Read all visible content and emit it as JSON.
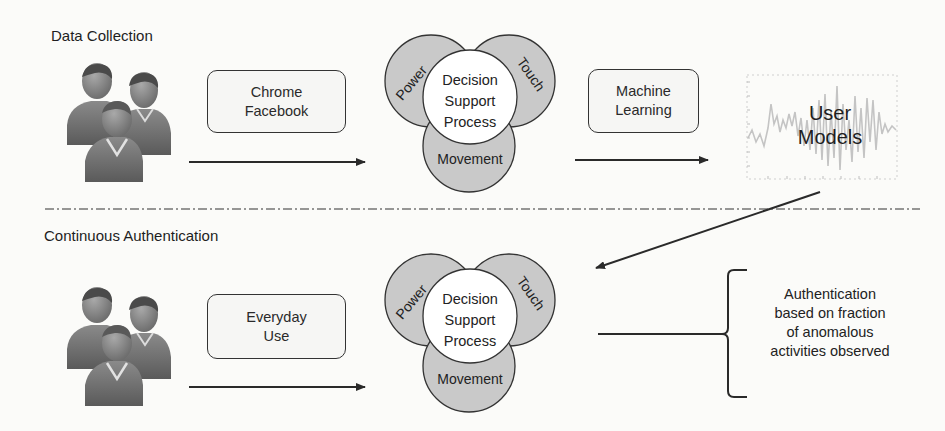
{
  "sections": {
    "data_collection": {
      "title": "Data Collection",
      "users_icon": "user-group-icon",
      "input_box": {
        "line1": "Chrome",
        "line2": "Facebook"
      },
      "venn": {
        "center": {
          "line1": "Decision",
          "line2": "Support",
          "line3": "Process"
        },
        "petals": [
          "Power",
          "Touch",
          "Movement"
        ]
      },
      "ml_box": {
        "line1": "Machine",
        "line2": "Learning"
      },
      "output": {
        "line1": "User",
        "line2": "Models",
        "background_icon": "waveform-chart-icon"
      }
    },
    "continuous_authentication": {
      "title": "Continuous Authentication",
      "users_icon": "user-group-icon",
      "input_box": {
        "line1": "Everyday",
        "line2": "Use"
      },
      "venn": {
        "center": {
          "line1": "Decision",
          "line2": "Support",
          "line3": "Process"
        },
        "petals": [
          "Power",
          "Touch",
          "Movement"
        ]
      },
      "outcome": {
        "line1": "Authentication",
        "line2": "based on fraction",
        "line3": "of anomalous",
        "line4": "activities observed"
      }
    }
  },
  "colors": {
    "petal_fill": "#c9c9c9",
    "center_fill": "#ffffff",
    "stroke": "#333333",
    "waveform": "#c8c8c8"
  }
}
